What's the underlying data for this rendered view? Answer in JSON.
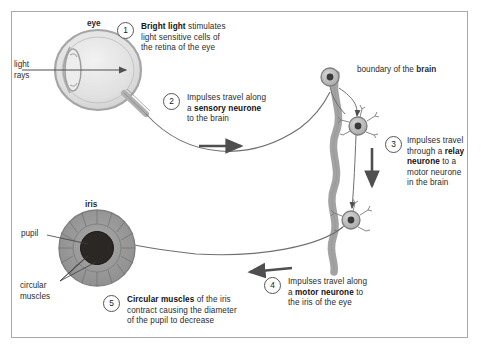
{
  "diagram": {
    "title_labels": {
      "eye": "eye",
      "iris": "iris",
      "pupil": "pupil",
      "circular_muscles_line1": "circular",
      "circular_muscles_line2": "muscles",
      "light_rays_line1": "light",
      "light_rays_line2": "rays",
      "brain_boundary_plain": "boundary of the ",
      "brain_boundary_bold": "brain"
    },
    "steps": [
      {
        "number": "1",
        "lines": [
          {
            "bold": "Bright light",
            "plain": " stimulates"
          },
          {
            "bold": "",
            "plain": "light sensitive cells of"
          },
          {
            "bold": "",
            "plain": "the retina of the eye"
          }
        ]
      },
      {
        "number": "2",
        "lines": [
          {
            "bold": "",
            "plain": "Impulses travel along"
          },
          {
            "bold": "sensory neurone",
            "plain": "a ",
            "bold_after": " "
          },
          {
            "bold": "",
            "plain": "to the brain"
          }
        ]
      },
      {
        "number": "3",
        "lines": [
          {
            "bold": "",
            "plain": "Impulses travel"
          },
          {
            "bold": "relay",
            "plain": "through a "
          },
          {
            "bold": "neurone",
            "plain": "",
            "after": " to a"
          },
          {
            "bold": "",
            "plain": "motor neurone"
          },
          {
            "bold": "",
            "plain": "in the brain"
          }
        ]
      },
      {
        "number": "4",
        "lines": [
          {
            "bold": "",
            "plain": "Impulses travel along"
          },
          {
            "bold": "motor neurone",
            "plain": "a ",
            "after": " to"
          },
          {
            "bold": "",
            "plain": "the iris of the eye"
          }
        ]
      },
      {
        "number": "5",
        "lines": [
          {
            "bold": "Circular muscles",
            "plain": "",
            "after": " of the iris"
          },
          {
            "bold": "",
            "plain": "contract causing the diameter"
          },
          {
            "bold": "",
            "plain": "of the pupil to decrease"
          }
        ]
      }
    ],
    "step1": {
      "num": "1",
      "l1a": "Bright light",
      "l1b": " stimulates",
      "l2": "light sensitive cells of",
      "l3": "the retina of the eye"
    },
    "step2": {
      "num": "2",
      "l1": "Impulses travel along",
      "l2a": "a ",
      "l2b": "sensory neurone",
      "l3": "to the brain"
    },
    "step3": {
      "num": "3",
      "l1": "Impulses travel",
      "l2a": "through a ",
      "l2b": "relay",
      "l3a": "neurone",
      "l3b": " to a",
      "l4": "motor neurone",
      "l5": "in the brain"
    },
    "step4": {
      "num": "4",
      "l1": "Impulses travel along",
      "l2a": "a ",
      "l2b": "motor neurone",
      "l2c": " to",
      "l3": "the iris of the eye"
    },
    "step5": {
      "num": "5",
      "l1a": "Circular muscles",
      "l1b": " of the iris",
      "l2": "contract causing the diameter",
      "l3": "of the pupil to decrease"
    },
    "colors": {
      "background": "#ffffff",
      "frame_border": "#a9a9a9",
      "text": "#2b2b2b",
      "eye_fill": "#e3e3e3",
      "eye_stroke": "#9a9a9a",
      "iris_fill": "#9c9c9c",
      "pupil_fill": "#2e2a28",
      "brain_band": "#a0a0a0",
      "neuron_fill": "#b5b5b5",
      "arrow": "#555555",
      "line": "#6b6b6b"
    }
  }
}
